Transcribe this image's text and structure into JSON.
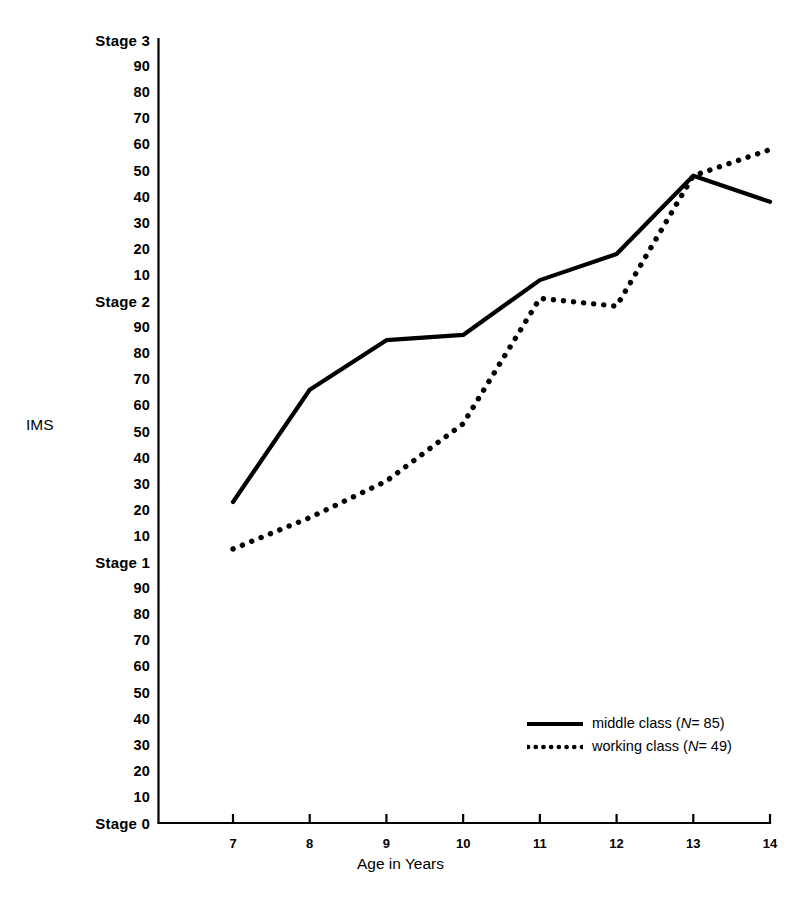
{
  "chart_data": {
    "type": "line",
    "title": "",
    "xlabel": "Age in Years",
    "ylabel": "IMS",
    "x": [
      7,
      8,
      9,
      10,
      11,
      12,
      13,
      14
    ],
    "xticklabels": [
      "7",
      "8",
      "9",
      "10",
      "11",
      "12",
      "13",
      "14"
    ],
    "xlim": [
      7,
      14
    ],
    "ylim": [
      0,
      300
    ],
    "grid": false,
    "legend_position": "lower right",
    "ytick_values": [
      0,
      10,
      20,
      30,
      40,
      50,
      60,
      70,
      80,
      90,
      100,
      110,
      120,
      130,
      140,
      150,
      160,
      170,
      180,
      190,
      200,
      210,
      220,
      230,
      240,
      250,
      260,
      270,
      280,
      290,
      300
    ],
    "yticklabels": [
      "Stage 0",
      "10",
      "20",
      "30",
      "40",
      "50",
      "60",
      "70",
      "80",
      "90",
      "Stage 1",
      "10",
      "20",
      "30",
      "40",
      "50",
      "60",
      "70",
      "80",
      "90",
      "Stage 2",
      "10",
      "20",
      "30",
      "40",
      "50",
      "60",
      "70",
      "80",
      "90",
      "Stage 3"
    ],
    "series": [
      {
        "name": "middle class",
        "n": 85,
        "legend_label": "middle class (N= 85)",
        "style": "solid",
        "color": "#000000",
        "values": [
          123,
          166,
          185,
          187,
          208,
          218,
          248,
          238
        ]
      },
      {
        "name": "working class",
        "n": 49,
        "legend_label": "working class (N= 49)",
        "style": "dotted",
        "color": "#000000",
        "values": [
          105,
          117,
          131,
          153,
          201,
          198,
          248,
          258
        ]
      }
    ]
  },
  "axes": {
    "x_title": "Age in Years",
    "y_title": "IMS"
  },
  "legend": {
    "items": [
      {
        "prefix": "middle class (",
        "italic": "N",
        "suffix": "= 85)",
        "style": "solid"
      },
      {
        "prefix": "working class (",
        "italic": "N",
        "suffix": "= 49)",
        "style": "dotted"
      }
    ]
  }
}
